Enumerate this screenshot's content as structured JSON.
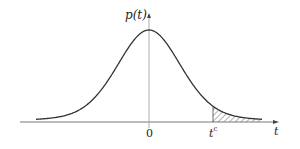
{
  "diagram": {
    "title": "",
    "type": "probability-density-curve",
    "y_axis_label": "p(t)",
    "x_axis_label": "t",
    "origin_tick_label": "0",
    "critical_value_label": {
      "base": "t",
      "superscript": "c"
    },
    "shaded_region": "right tail beyond t^c (hatched)",
    "colors": {
      "curve": "#333333",
      "axis": "#555555",
      "hatch": "#555555",
      "background": "#ffffff"
    }
  }
}
